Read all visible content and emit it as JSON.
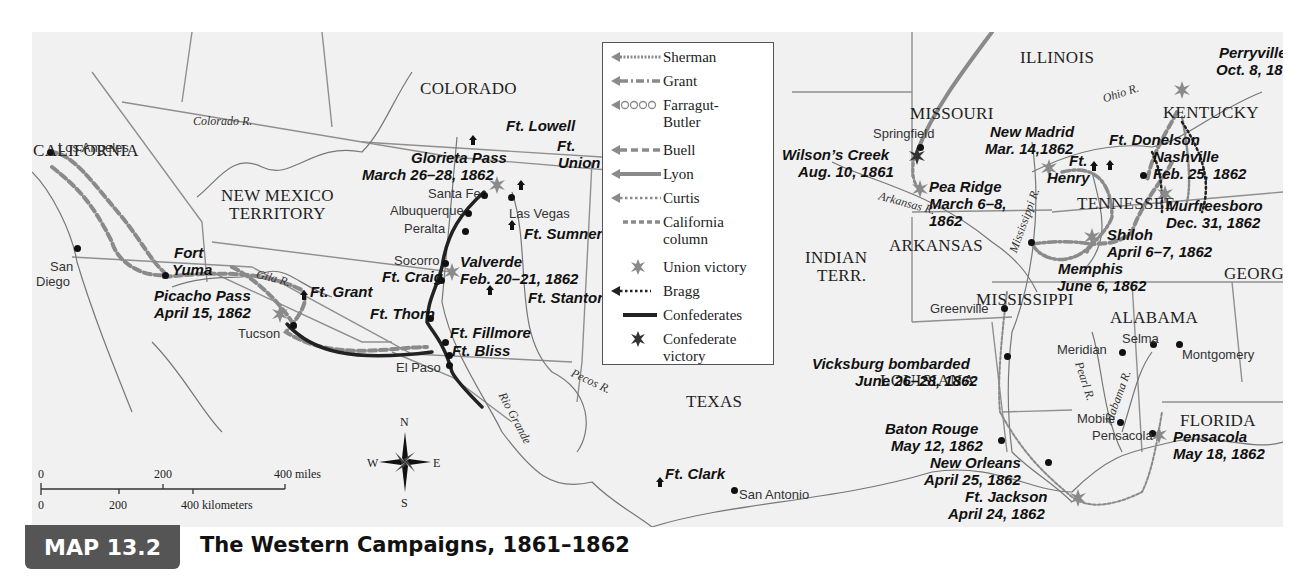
{
  "caption": {
    "map_number": "MAP 13.2",
    "title": "The Western Campaigns, 1861–1862",
    "badge_color": "#555555"
  },
  "legend": {
    "items": [
      {
        "key": "sherman",
        "label": "Sherman",
        "style": "fine-dotted arrow"
      },
      {
        "key": "grant",
        "label": "Grant",
        "style": "dash-dot arrow"
      },
      {
        "key": "farragut",
        "label": "Farragut-Butler",
        "label_lines": [
          "Farragut-",
          "Butler"
        ],
        "style": "circle chain arrow"
      },
      {
        "key": "buell",
        "label": "Buell",
        "style": "dashed arrow"
      },
      {
        "key": "lyon",
        "label": "Lyon",
        "style": "solid gray arrow"
      },
      {
        "key": "curtis",
        "label": "Curtis",
        "style": "dotted arrow"
      },
      {
        "key": "california",
        "label": "California column",
        "label_lines": [
          "California",
          "column"
        ],
        "style": "dashed line"
      },
      {
        "key": "union_victory",
        "label": "Union victory",
        "style": "gray star"
      },
      {
        "key": "bragg",
        "label": "Bragg",
        "style": "black dotted arrow"
      },
      {
        "key": "confederates",
        "label": "Confederates",
        "style": "solid black line"
      },
      {
        "key": "confederate_victory",
        "label": "Confederate victory",
        "label_lines": [
          "Confederate",
          "victory"
        ],
        "style": "black star"
      }
    ]
  },
  "regions": {
    "california": "CALIFORNIA",
    "colorado": "COLORADO",
    "nm_territory_1": "NEW MEXICO",
    "nm_territory_2": "TERRITORY",
    "texas": "TEXAS",
    "missouri": "MISSOURI",
    "illinois": "ILLINOIS",
    "kentucky": "KENTUCKY",
    "tennessee": "TENNESSEE",
    "arkansas": "ARKANSAS",
    "indian_terr_1": "INDIAN",
    "indian_terr_2": "TERR.",
    "mississippi": "MISSISSIPPI",
    "alabama": "ALABAMA",
    "georgia": "GEORGIA",
    "louisiana": "LOUISIANA",
    "florida": "FLORIDA"
  },
  "rivers": {
    "colorado": "Colorado R.",
    "gila": "Gila R.",
    "rio_grande": "Rio Grande",
    "pecos": "Pecos R.",
    "arkansas": "Arkansas R.",
    "ohio": "Ohio R.",
    "mississippi": "Mississippi R.",
    "pearl": "Pearl R.",
    "alabama": "Alabama R."
  },
  "cities": {
    "los_angeles": "Los Angeles",
    "san_diego_1": "San",
    "san_diego_2": "Diego",
    "tucson": "Tucson",
    "el_paso": "El Paso",
    "santa_fe": "Santa Fe",
    "albuquerque": "Albuquerque",
    "peralta": "Peralta",
    "socorro": "Socorro",
    "las_vegas": "Las Vegas",
    "san_antonio": "San Antonio",
    "springfield": "Springfield",
    "greenville": "Greenville",
    "meridian": "Meridian",
    "selma": "Selma",
    "montgomery": "Montgomery",
    "mobile": "Mobile",
    "pensacola": "Pensacola"
  },
  "forts": {
    "fort_yuma_1": "Fort",
    "fort_yuma_2": "Yuma",
    "ft_grant": "Ft. Grant",
    "ft_lowell": "Ft. Lowell",
    "ft_union_1": "Ft.",
    "ft_union_2": "Union",
    "ft_sumner": "Ft. Sumner",
    "ft_stanton": "Ft. Stanton",
    "ft_craig": "Ft. Craig",
    "ft_thorn": "Ft. Thorn",
    "ft_fillmore": "Ft. Fillmore",
    "ft_bliss": "Ft. Bliss",
    "ft_clark": "Ft. Clark",
    "ft_henry_1": "Ft.",
    "ft_henry_2": "Henry",
    "ft_donelson": "Ft. Donelson"
  },
  "battles": {
    "picacho_pass": {
      "name": "Picacho Pass",
      "date": "April 15, 1862",
      "result": "union"
    },
    "glorieta_pass": {
      "name": "Glorieta Pass",
      "date": "March 26–28, 1862",
      "result": "union"
    },
    "valverde": {
      "name": "Valverde",
      "date": "Feb. 20–21, 1862",
      "result": "union"
    },
    "wilsons_creek": {
      "name": "Wilson’s Creek",
      "date": "Aug. 10, 1861",
      "result": "confederate"
    },
    "pea_ridge": {
      "name": "Pea Ridge",
      "date_1": "March 6–8,",
      "date_2": "1862",
      "result": "union"
    },
    "new_madrid": {
      "name": "New Madrid",
      "date": "Mar. 14,1862",
      "result": "union"
    },
    "perryville": {
      "name": "Perryville",
      "date": "Oct. 8, 1862",
      "result": "union"
    },
    "nashville": {
      "name": "Nashville",
      "date": "Feb. 25, 1862"
    },
    "murfreesboro": {
      "name": "Murfreesboro",
      "date": "Dec. 31, 1862",
      "result": "union"
    },
    "shiloh": {
      "name": "Shiloh",
      "date": "April 6–7, 1862",
      "result": "union"
    },
    "memphis": {
      "name": "Memphis",
      "date": "June 6, 1862"
    },
    "vicksburg": {
      "name": "Vicksburg bombarded",
      "date": "June 26–28, 1862"
    },
    "baton_rouge": {
      "name": "Baton Rouge",
      "date": "May 12, 1862"
    },
    "new_orleans": {
      "name": "New Orleans",
      "date": "April 25, 1862"
    },
    "ft_jackson": {
      "name": "Ft. Jackson",
      "date": "April 24, 1862",
      "result": "union"
    },
    "pensacola": {
      "name": "Pensacola",
      "date": "May 18, 1862",
      "result": "union"
    }
  },
  "scale": {
    "miles": [
      "0",
      "200",
      "400 miles"
    ],
    "kilometers": [
      "0",
      "200",
      "400 kilometers"
    ]
  },
  "compass": {
    "n": "N",
    "s": "S",
    "e": "E",
    "w": "W"
  },
  "colors": {
    "union_route": "#8a8a8a",
    "confederate_route": "#222222",
    "land": "#f1f1f1",
    "border": "#8c8c8c"
  }
}
